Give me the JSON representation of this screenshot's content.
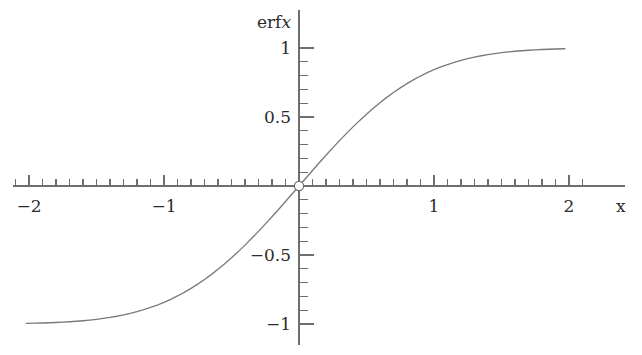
{
  "figure": {
    "background_color": "#ffffff",
    "axis_color": "#6e6e6e",
    "curve_color": "#7a7a7a",
    "text_color": "#2b2b2b"
  },
  "labels": {
    "y_axis_label_function": "erf",
    "y_axis_label_variable": "x",
    "x_axis_label": "x"
  },
  "x_tick_labels": [
    {
      "value": -2,
      "text": "−2"
    },
    {
      "value": -1,
      "text": "−1"
    },
    {
      "value": 1,
      "text": "1"
    },
    {
      "value": 2,
      "text": "2"
    }
  ],
  "y_tick_labels": [
    {
      "value": 1,
      "text": "1"
    },
    {
      "value": 0.5,
      "text": "0.5"
    },
    {
      "value": -0.5,
      "text": "−0.5"
    },
    {
      "value": -1,
      "text": "−1"
    }
  ],
  "chart_data": {
    "type": "line",
    "title": "",
    "subtitle": "",
    "xlabel": "x",
    "ylabel": "erf x",
    "xlim": [
      -2.2,
      2.4
    ],
    "ylim": [
      -1.28,
      1.28
    ],
    "grid": false,
    "legend": null,
    "legend_position": "none",
    "x_major_ticks": [
      -2,
      -1,
      1,
      2
    ],
    "x_minor_tick_step": 0.1,
    "y_major_ticks": [
      -1,
      -0.5,
      0.5,
      1
    ],
    "y_minor_tick_step": 0.1,
    "axis_style": "centered-cross",
    "annotations": [
      {
        "type": "open-circle-marker",
        "x": 0,
        "y": 0,
        "label": "origin"
      }
    ],
    "series": [
      {
        "name": "erf x",
        "color": "#7a7a7a",
        "x": [
          -2.02,
          -1.95,
          -1.9,
          -1.85,
          -1.8,
          -1.75,
          -1.7,
          -1.65,
          -1.6,
          -1.55,
          -1.5,
          -1.45,
          -1.4,
          -1.35,
          -1.3,
          -1.25,
          -1.2,
          -1.15,
          -1.1,
          -1.05,
          -1.0,
          -0.95,
          -0.9,
          -0.85,
          -0.8,
          -0.75,
          -0.7,
          -0.65,
          -0.6,
          -0.55,
          -0.5,
          -0.45,
          -0.4,
          -0.35,
          -0.3,
          -0.25,
          -0.2,
          -0.15,
          -0.1,
          -0.05,
          0.0,
          0.05,
          0.1,
          0.15,
          0.2,
          0.25,
          0.3,
          0.35,
          0.4,
          0.45,
          0.5,
          0.55,
          0.6,
          0.65,
          0.7,
          0.75,
          0.8,
          0.85,
          0.9,
          0.95,
          1.0,
          1.05,
          1.1,
          1.15,
          1.2,
          1.25,
          1.3,
          1.35,
          1.4,
          1.45,
          1.5,
          1.55,
          1.6,
          1.65,
          1.7,
          1.75,
          1.8,
          1.85,
          1.9,
          1.97
        ],
        "y": [
          -0.99557,
          -0.99418,
          -0.99279,
          -0.99111,
          -0.98909,
          -0.98667,
          -0.98379,
          -0.98038,
          -0.97635,
          -0.97162,
          -0.96611,
          -0.9597,
          -0.95229,
          -0.94376,
          -0.93401,
          -0.9229,
          -0.91031,
          -0.89612,
          -0.88021,
          -0.86244,
          -0.8427,
          -0.82089,
          -0.79691,
          -0.77067,
          -0.7421,
          -0.71116,
          -0.6778,
          -0.64203,
          -0.60386,
          -0.56332,
          -0.5205,
          -0.47548,
          -0.42839,
          -0.37938,
          -0.32863,
          -0.27633,
          -0.2227,
          -0.168,
          -0.11246,
          -0.05637,
          0.0,
          0.05637,
          0.11246,
          0.168,
          0.2227,
          0.27633,
          0.32863,
          0.37938,
          0.42839,
          0.47548,
          0.5205,
          0.56332,
          0.60386,
          0.64203,
          0.6778,
          0.71116,
          0.7421,
          0.77067,
          0.79691,
          0.82089,
          0.8427,
          0.86244,
          0.88021,
          0.89612,
          0.91031,
          0.9229,
          0.93401,
          0.94376,
          0.95229,
          0.9597,
          0.96611,
          0.97162,
          0.97635,
          0.98038,
          0.98379,
          0.98667,
          0.98909,
          0.99111,
          0.99279,
          0.99484
        ]
      }
    ]
  }
}
